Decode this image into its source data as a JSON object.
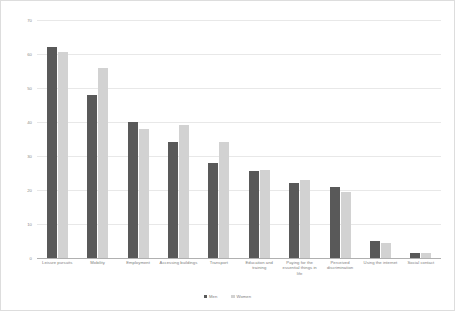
{
  "chart_data": {
    "type": "bar",
    "title": "",
    "subtitle": "",
    "xlabel": "",
    "ylabel": "",
    "ylim": [
      0,
      70
    ],
    "yticks": [
      0,
      10,
      20,
      30,
      40,
      50,
      60,
      70
    ],
    "ytick_labels": [
      "0",
      "10",
      "20",
      "30",
      "40",
      "50",
      "60",
      "70"
    ],
    "grid": true,
    "legend_position": "bottom-center",
    "categories": [
      "Leisure pursuits",
      "Mobility",
      "Employment",
      "Accessing buildings",
      "Transport",
      "Education and training",
      "Paying for the essential things in life",
      "Perceived discrimination",
      "Using the internet",
      "Social contact"
    ],
    "series": [
      {
        "name": "Men",
        "color": "#595959",
        "values": [
          62,
          48,
          40,
          34,
          28,
          25.5,
          22,
          21,
          5,
          1.5
        ]
      },
      {
        "name": "Women",
        "color": "#d2d2d2",
        "values": [
          60.5,
          56,
          38,
          39,
          34,
          26,
          23,
          19.5,
          4.5,
          1.5
        ]
      }
    ]
  },
  "legend": {
    "items": [
      {
        "label": "Men",
        "marker": "square-swatch-dark"
      },
      {
        "label": "Women",
        "marker": "square-swatch-light"
      }
    ]
  }
}
